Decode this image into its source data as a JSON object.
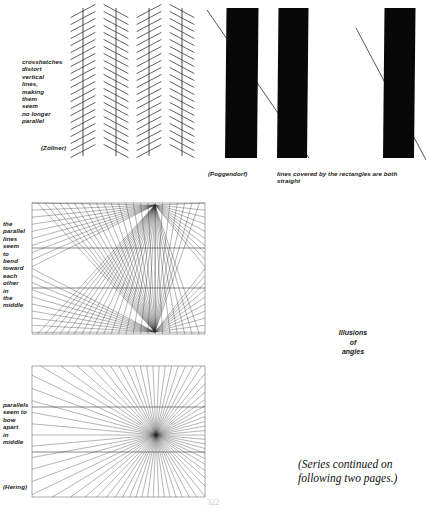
{
  "page": {
    "width": 426,
    "height": 508,
    "background": "#ffffff",
    "ink": "#1a1a1a",
    "page_number": "322"
  },
  "figures": {
    "zollner": {
      "name": "Zollner illusion",
      "caption": "crosshatches\ndistort\nvertical\nlines,\nmaking\nthem\nseem\nno longer\nparallel",
      "attribution": "(Zöllner)",
      "frame": {
        "x": 75,
        "y": 8,
        "w": 126,
        "h": 148
      },
      "vertical_lines_x": [
        83,
        116,
        149,
        182
      ],
      "hatch_spacing": 7.0,
      "hatch_angle_deg": 28,
      "hatch_half_length": 14
    },
    "poggendorf": {
      "name": "Poggendorf illusion",
      "attribution": "(Poggendorf)",
      "caption": "lines covered by the rectangles are both\nstraight",
      "rectangles": [
        {
          "x": 225,
          "y": 8,
          "w": 32,
          "h": 150,
          "tilt": 1.5
        },
        {
          "x": 277,
          "y": 8,
          "w": 30,
          "h": 150,
          "tilt": 1.5
        },
        {
          "x": 383,
          "y": 8,
          "w": 31,
          "h": 150,
          "tilt": 1.5
        }
      ],
      "diagonals": [
        {
          "x1": 207,
          "y1": 10,
          "x2": 309,
          "y2": 158
        },
        {
          "x1": 356,
          "y1": 28,
          "x2": 426,
          "y2": 160
        }
      ]
    },
    "wundt": {
      "name": "Wundt / Hering double-point illusion",
      "caption": "the\nparallel\nlines\nseem\nto\nbend\ntoward\neach\nother\nin\nthe\nmiddle",
      "frame": {
        "x": 32,
        "y": 203,
        "w": 173,
        "h": 131
      },
      "focus_top": {
        "x": 155,
        "y": 205
      },
      "focus_bottom": {
        "x": 155,
        "y": 332
      },
      "ray_count": 42,
      "parallels_y": [
        248,
        288
      ]
    },
    "hering": {
      "name": "Hering illusion",
      "attribution": "(Hering)",
      "caption": "parallels\nseem to\nbow\napart\nin\nmiddle",
      "frame": {
        "x": 32,
        "y": 366,
        "w": 173,
        "h": 131
      },
      "focus": {
        "x": 156,
        "y": 435
      },
      "ray_count": 70,
      "parallels_y": [
        407,
        452
      ]
    }
  },
  "labels": {
    "section_title": "Illusions\nof\nangles",
    "continuation_note": "(Series continued on\nfollowing two pages.)"
  }
}
